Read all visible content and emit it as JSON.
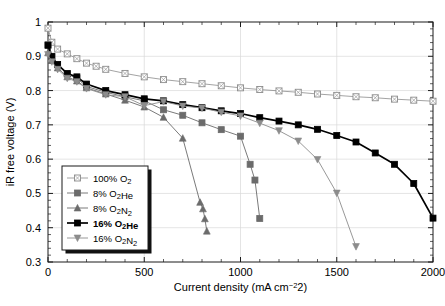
{
  "chart_data": {
    "type": "line",
    "title": "",
    "xlabel": "Current density (mA cm−2)",
    "ylabel": "iR free voltage (V)",
    "xlim": [
      0,
      2000
    ],
    "ylim": [
      0.3,
      1.0
    ],
    "xticks": [
      0,
      500,
      1000,
      1500,
      2000
    ],
    "xtick_labels": [
      "0",
      "500",
      "1000",
      "1500",
      "2000"
    ],
    "yticks": [
      0.3,
      0.4,
      0.5,
      0.6,
      0.7,
      0.8,
      0.9,
      1.0
    ],
    "ytick_labels": [
      "0.3",
      "0.4",
      "0.5",
      "0.6",
      "0.7",
      "0.8",
      "0.9",
      "1"
    ],
    "x_minor_step": 100,
    "y_minor_step": 0.02,
    "grid": true,
    "legend_position": "lower-left-inside",
    "series": [
      {
        "name": "100% O2",
        "label_main": "100% O",
        "label_sub": "2",
        "label_tail": "",
        "marker": "square-open",
        "color": "#8c8c8c",
        "line_width": 0.8,
        "bold": false,
        "points": [
          [
            0,
            0.982
          ],
          [
            20,
            0.941
          ],
          [
            50,
            0.921
          ],
          [
            100,
            0.907
          ],
          [
            150,
            0.893
          ],
          [
            200,
            0.88
          ],
          [
            250,
            0.871
          ],
          [
            300,
            0.862
          ],
          [
            400,
            0.85
          ],
          [
            500,
            0.84
          ],
          [
            600,
            0.832
          ],
          [
            700,
            0.826
          ],
          [
            800,
            0.82
          ],
          [
            900,
            0.814
          ],
          [
            1000,
            0.808
          ],
          [
            1100,
            0.803
          ],
          [
            1200,
            0.799
          ],
          [
            1300,
            0.795
          ],
          [
            1400,
            0.79
          ],
          [
            1500,
            0.786
          ],
          [
            1600,
            0.782
          ],
          [
            1700,
            0.779
          ],
          [
            1800,
            0.775
          ],
          [
            1900,
            0.772
          ],
          [
            2000,
            0.769
          ]
        ]
      },
      {
        "name": "8% O2He",
        "label_main": "8% O",
        "label_sub": "2",
        "label_tail": "He",
        "marker": "square-filled",
        "color": "#6b6b6b",
        "line_width": 0.9,
        "bold": false,
        "points": [
          [
            0,
            0.934
          ],
          [
            20,
            0.9
          ],
          [
            50,
            0.875
          ],
          [
            100,
            0.848
          ],
          [
            150,
            0.836
          ],
          [
            200,
            0.812
          ],
          [
            300,
            0.795
          ],
          [
            400,
            0.782
          ],
          [
            500,
            0.77
          ],
          [
            600,
            0.744
          ],
          [
            700,
            0.728
          ],
          [
            800,
            0.706
          ],
          [
            900,
            0.686
          ],
          [
            1000,
            0.667
          ],
          [
            1050,
            0.585
          ],
          [
            1075,
            0.539
          ],
          [
            1100,
            0.427
          ]
        ]
      },
      {
        "name": "8% O2N2",
        "label_main": "8% O",
        "label_sub": "2",
        "label_tail": "N",
        "label_tail_sub": "2",
        "marker": "triangle-up",
        "color": "#6b6b6b",
        "line_width": 0.9,
        "bold": false,
        "points": [
          [
            0,
            0.91
          ],
          [
            20,
            0.888
          ],
          [
            50,
            0.866
          ],
          [
            100,
            0.84
          ],
          [
            150,
            0.828
          ],
          [
            200,
            0.808
          ],
          [
            300,
            0.79
          ],
          [
            400,
            0.772
          ],
          [
            500,
            0.752
          ],
          [
            600,
            0.722
          ],
          [
            700,
            0.661
          ],
          [
            790,
            0.474
          ],
          [
            805,
            0.455
          ],
          [
            815,
            0.426
          ],
          [
            825,
            0.39
          ]
        ]
      },
      {
        "name": "16% O2He",
        "label_main": "16% O",
        "label_sub": "2",
        "label_tail": "He",
        "marker": "square-filled",
        "color": "#000000",
        "line_width": 1.7,
        "bold": true,
        "points": [
          [
            0,
            0.932
          ],
          [
            20,
            0.899
          ],
          [
            50,
            0.876
          ],
          [
            100,
            0.85
          ],
          [
            150,
            0.84
          ],
          [
            200,
            0.819
          ],
          [
            300,
            0.8
          ],
          [
            400,
            0.788
          ],
          [
            500,
            0.776
          ],
          [
            600,
            0.77
          ],
          [
            700,
            0.759
          ],
          [
            800,
            0.75
          ],
          [
            900,
            0.741
          ],
          [
            1000,
            0.733
          ],
          [
            1100,
            0.721
          ],
          [
            1200,
            0.711
          ],
          [
            1300,
            0.7
          ],
          [
            1400,
            0.687
          ],
          [
            1500,
            0.669
          ],
          [
            1600,
            0.65
          ],
          [
            1700,
            0.618
          ],
          [
            1800,
            0.585
          ],
          [
            1900,
            0.529
          ],
          [
            2000,
            0.428
          ]
        ]
      },
      {
        "name": "16% O2N2",
        "label_main": "16% O",
        "label_sub": "2",
        "label_tail": "N",
        "label_tail_sub": "2",
        "marker": "triangle-down",
        "color": "#8c8c8c",
        "line_width": 0.9,
        "bold": false,
        "points": [
          [
            0,
            0.905
          ],
          [
            20,
            0.884
          ],
          [
            50,
            0.862
          ],
          [
            100,
            0.836
          ],
          [
            150,
            0.826
          ],
          [
            200,
            0.806
          ],
          [
            300,
            0.788
          ],
          [
            400,
            0.782
          ],
          [
            500,
            0.756
          ],
          [
            600,
            0.768
          ],
          [
            700,
            0.755
          ],
          [
            800,
            0.749
          ],
          [
            900,
            0.737
          ],
          [
            1000,
            0.726
          ],
          [
            1100,
            0.705
          ],
          [
            1200,
            0.683
          ],
          [
            1300,
            0.653
          ],
          [
            1400,
            0.599
          ],
          [
            1500,
            0.501
          ],
          [
            1600,
            0.345
          ]
        ]
      }
    ]
  },
  "legend": {
    "entries": [
      {
        "label": "100% O₂",
        "marker": "square-open",
        "bold": false
      },
      {
        "label": "8% O₂He",
        "marker": "square-filled",
        "bold": false
      },
      {
        "label": "8% O₂N₂",
        "marker": "triangle-up",
        "bold": false
      },
      {
        "label": "16% O₂He",
        "marker": "square-filled",
        "bold": true
      },
      {
        "label": "16% O₂N₂",
        "marker": "triangle-down",
        "bold": false
      }
    ]
  },
  "colors": {
    "grid": "#d9d9d9",
    "axis": "#1a1a1a",
    "gray_light": "#8c8c8c",
    "gray_mid": "#6b6b6b",
    "black": "#000000",
    "background": "#ffffff"
  }
}
